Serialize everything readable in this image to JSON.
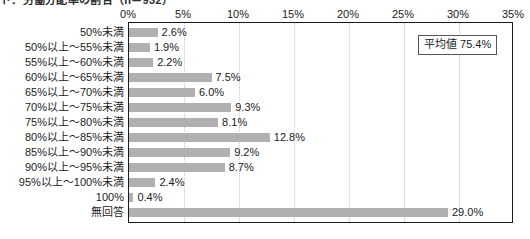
{
  "title": "ト：労働分配率の割合（n＝932）",
  "annotation": {
    "label": "平均値 75.4%"
  },
  "chart_data": {
    "type": "bar",
    "orientation": "horizontal",
    "title": "ト：労働分配率の割合（n＝932）",
    "xlabel": "",
    "ylabel": "",
    "xlim": [
      0,
      35
    ],
    "xticks": [
      "0%",
      "5%",
      "10%",
      "15%",
      "20%",
      "25%",
      "30%",
      "35%"
    ],
    "xtick_values": [
      0,
      5,
      10,
      15,
      20,
      25,
      30,
      35
    ],
    "grid": "vertical-dotted",
    "legend": "none",
    "bar_color": "#b0b0b0",
    "categories": [
      "50%未満",
      "50%以上～55%未満",
      "55%以上～60%未満",
      "60%以上～65%未満",
      "65%以上～70%未満",
      "70%以上～75%未満",
      "75%以上～80%未満",
      "80%以上～85%未満",
      "85%以上～90%未満",
      "90%以上～95%未満",
      "95%以上～100%未満",
      "100%",
      "無回答"
    ],
    "values": [
      2.6,
      1.9,
      2.2,
      7.5,
      6.0,
      9.3,
      8.1,
      12.8,
      9.2,
      8.7,
      2.4,
      0.4,
      29.0
    ],
    "value_labels": [
      "2.6%",
      "1.9%",
      "2.2%",
      "7.5%",
      "6.0%",
      "9.3%",
      "8.1%",
      "12.8%",
      "9.2%",
      "8.7%",
      "2.4%",
      "0.4%",
      "29.0%"
    ],
    "annotations": [
      {
        "text": "平均値 75.4%",
        "x": 26.4,
        "y": 0.9
      }
    ]
  }
}
